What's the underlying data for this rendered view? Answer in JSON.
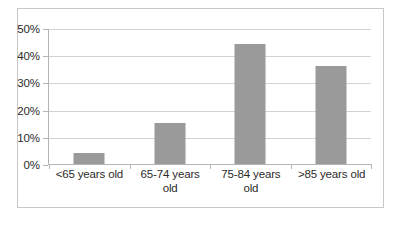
{
  "chart_data": {
    "type": "bar",
    "title": "",
    "xlabel": "",
    "ylabel": "",
    "categories": [
      "<65 years old",
      "65-74 years old",
      "75-84 years old",
      ">85 years old"
    ],
    "values": [
      4,
      15,
      44,
      36
    ],
    "value_labels": [
      "4%",
      "15%",
      "44%",
      "36%"
    ],
    "ylim": [
      0,
      50
    ],
    "ytick_values": [
      50,
      40,
      30,
      20,
      10,
      0
    ],
    "ytick_labels": [
      "50%",
      "40%",
      "30%",
      "20%",
      "10%",
      "0%"
    ],
    "grid": true,
    "legend": false,
    "legend_position": "none",
    "series": [
      {
        "name": "",
        "values": [
          4,
          15,
          44,
          36
        ]
      }
    ],
    "colors": {
      "bar": "#9a9a9a",
      "gridline": "#d3d3d3",
      "axis": "#b5b5b5",
      "frame": "#c8c8c8",
      "text": "#2b2b2b",
      "background": "#ffffff"
    }
  },
  "caption": {
    "fragment": ""
  }
}
